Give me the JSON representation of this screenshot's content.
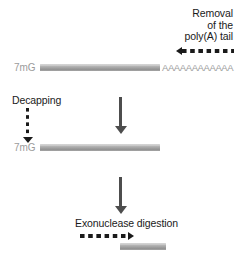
{
  "diagram": {
    "background_color": "#ffffff",
    "bar_color": "#a8a8a8",
    "cap_label_color": "#9b9b9b",
    "text_color": "#1a1a1a"
  },
  "labels": {
    "removal_line1": "Removal",
    "removal_line2": "of the",
    "removal_line3": "poly(A) tail",
    "decapping": "Decapping",
    "exonuclease": "Exonuclease digestion",
    "cap_top": "7mG",
    "cap_middle": "7mG",
    "polya_tail": "AAAAAAAAAAAA"
  },
  "steps": [
    {
      "name": "capped-polyadenylated-mrna",
      "cap": "7mG",
      "tail": "AAAAAAAAAAAA",
      "annotation": "Removal of the poly(A) tail",
      "annotation_arrow": "dashed-left"
    },
    {
      "name": "deadenylated-capped-mrna",
      "cap": "7mG",
      "tail": "",
      "annotation": "Decapping",
      "annotation_arrow": "dashed-down"
    },
    {
      "name": "decapped-mrna-fragment",
      "cap": "",
      "tail": "",
      "annotation": "Exonuclease digestion",
      "annotation_arrow": "dashed-right"
    }
  ]
}
